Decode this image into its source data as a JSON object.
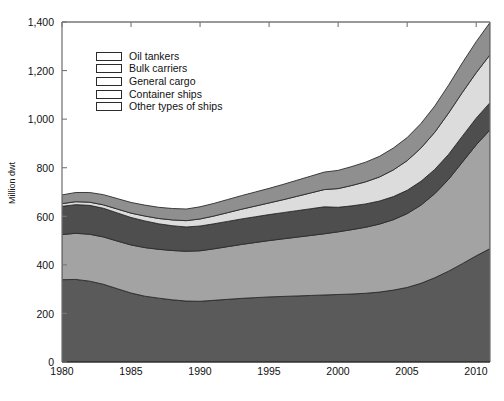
{
  "chart_data": {
    "type": "area",
    "title": "",
    "subtitle": "",
    "xlabel": "",
    "ylabel": "Million dwt",
    "xlim": [
      1980,
      2011
    ],
    "ylim": [
      0,
      1400
    ],
    "grid": false,
    "stacked": true,
    "legend_position": "upper-left-inside",
    "x": [
      1980,
      1981,
      1982,
      1983,
      1984,
      1985,
      1986,
      1987,
      1988,
      1989,
      1990,
      1991,
      1992,
      1993,
      1994,
      1995,
      1996,
      1997,
      1998,
      1999,
      2000,
      2001,
      2002,
      2003,
      2004,
      2005,
      2006,
      2007,
      2008,
      2009,
      2010,
      2011
    ],
    "xticks": [
      1980,
      1985,
      1990,
      1995,
      2000,
      2005,
      2010
    ],
    "xtick_labels": [
      "1980",
      "1985",
      "1990",
      "1995",
      "2000",
      "2005",
      "2010"
    ],
    "yticks": [
      0,
      200,
      400,
      600,
      800,
      1000,
      1200,
      1400
    ],
    "ytick_labels": [
      "0",
      "200",
      "400",
      "600",
      "800",
      "1,000",
      "1,200",
      "1,400"
    ],
    "series": [
      {
        "name": "Oil tankers",
        "color": "#5a5a5a",
        "values": [
          339,
          340,
          333,
          320,
          302,
          284,
          271,
          263,
          256,
          251,
          250,
          254,
          258,
          262,
          265,
          268,
          270,
          272,
          274,
          276,
          278,
          280,
          283,
          288,
          296,
          307,
          324,
          347,
          374,
          405,
          437,
          467
        ]
      },
      {
        "name": "Bulk carriers",
        "color": "#a3a3a3",
        "values": [
          186,
          190,
          193,
          195,
          196,
          198,
          200,
          201,
          203,
          205,
          208,
          212,
          217,
          222,
          227,
          232,
          237,
          242,
          247,
          252,
          258,
          265,
          272,
          280,
          290,
          304,
          322,
          346,
          378,
          418,
          457,
          489
        ]
      },
      {
        "name": "General cargo",
        "color": "#4e4e4e",
        "values": [
          116,
          118,
          119,
          118,
          116,
          113,
          110,
          105,
          102,
          100,
          102,
          103,
          104,
          105,
          106,
          107,
          108,
          109,
          110,
          111,
          101,
          98,
          96,
          95,
          95,
          96,
          98,
          100,
          103,
          107,
          110,
          112
        ]
      },
      {
        "name": "Container ships",
        "color": "#dcdcdc",
        "values": [
          11,
          12,
          13,
          14,
          16,
          18,
          20,
          22,
          24,
          26,
          29,
          32,
          36,
          40,
          44,
          48,
          53,
          59,
          65,
          71,
          77,
          84,
          91,
          99,
          110,
          122,
          137,
          153,
          170,
          180,
          187,
          197
        ]
      },
      {
        "name": "Other types of ships",
        "color": "#8f8f8f",
        "values": [
          36,
          38,
          40,
          42,
          43,
          44,
          45,
          46,
          47,
          48,
          50,
          52,
          54,
          56,
          58,
          60,
          63,
          66,
          69,
          72,
          75,
          78,
          81,
          85,
          90,
          95,
          101,
          108,
          115,
          122,
          128,
          133
        ]
      }
    ],
    "totals": [
      688,
      698,
      698,
      689,
      673,
      657,
      646,
      637,
      632,
      630,
      639,
      653,
      669,
      685,
      700,
      715,
      731,
      748,
      765,
      782,
      789,
      805,
      823,
      847,
      881,
      924,
      982,
      1054,
      1140,
      1232,
      1319,
      1398
    ]
  },
  "legend": {
    "items": [
      {
        "label": "Oil tankers"
      },
      {
        "label": "Bulk carriers"
      },
      {
        "label": "General cargo"
      },
      {
        "label": "Container ships"
      },
      {
        "label": "Other types of ships"
      }
    ]
  },
  "axes": {
    "y_title": "Million dwt",
    "y_tick_labels": [
      "1,400",
      "1,200",
      "1,000",
      "800",
      "600",
      "400",
      "200",
      "0"
    ],
    "x_tick_labels": [
      "1980",
      "1985",
      "1990",
      "1995",
      "2000",
      "2005",
      "2010"
    ]
  }
}
